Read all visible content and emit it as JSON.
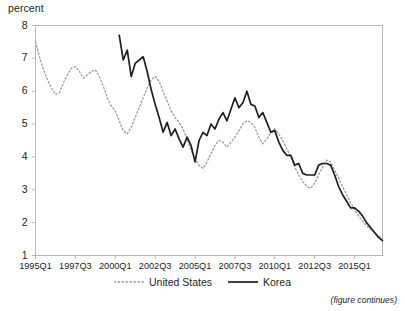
{
  "figure": {
    "axis_unit_label": "percent",
    "note": "(figure continues)"
  },
  "legend": {
    "entries": [
      {
        "label": "United States",
        "style": "dotted",
        "color": "#9a9a9a",
        "icon": "dotted-line-swatch-icon"
      },
      {
        "label": "Korea",
        "style": "solid",
        "color": "#231f20",
        "icon": "solid-line-swatch-icon"
      }
    ]
  },
  "chart_data": {
    "type": "line",
    "title": "",
    "subtitle": "",
    "xlabel": "",
    "ylabel": "percent",
    "ylim": [
      1,
      8
    ],
    "yticks": [
      1,
      2,
      3,
      4,
      5,
      6,
      7,
      8
    ],
    "ytick_labels": [
      "1",
      "2",
      "3",
      "4",
      "5",
      "6",
      "7",
      "8"
    ],
    "xtick_labels": [
      "1995Q1",
      "1997Q3",
      "2000Q1",
      "2002Q3",
      "2005Q1",
      "2007Q3",
      "2010Q1",
      "2012Q3",
      "2015Q1"
    ],
    "xtick_indices": [
      0,
      10,
      20,
      30,
      40,
      50,
      60,
      70,
      80
    ],
    "grid": false,
    "legend_position": "bottom-center",
    "x_start": "1995Q1",
    "x_end": "2016Q4",
    "n_periods": 88,
    "series": [
      {
        "name": "United States",
        "style": "dotted",
        "color": "#9a9a9a",
        "start_index": 0,
        "values": [
          7.5,
          7.05,
          6.65,
          6.35,
          6.1,
          5.9,
          5.95,
          6.25,
          6.5,
          6.7,
          6.75,
          6.6,
          6.4,
          6.5,
          6.6,
          6.65,
          6.45,
          6.15,
          5.8,
          5.55,
          5.4,
          5.1,
          4.8,
          4.7,
          4.9,
          5.2,
          5.5,
          5.8,
          6.1,
          6.35,
          6.45,
          6.3,
          6.0,
          5.7,
          5.4,
          5.2,
          5.05,
          4.85,
          4.55,
          4.2,
          3.95,
          3.75,
          3.65,
          3.85,
          4.1,
          4.35,
          4.5,
          4.45,
          4.3,
          4.45,
          4.6,
          4.8,
          5.0,
          5.1,
          5.05,
          4.9,
          4.6,
          4.4,
          4.55,
          4.75,
          4.85,
          4.7,
          4.5,
          4.25,
          4.0,
          3.7,
          3.45,
          3.25,
          3.1,
          3.05,
          3.2,
          3.45,
          3.7,
          3.9,
          3.85,
          3.6,
          3.35,
          3.1,
          2.85,
          2.6,
          2.4,
          2.2,
          2.05,
          1.9,
          1.8,
          1.7,
          1.6,
          1.5
        ]
      },
      {
        "name": "Korea",
        "style": "solid",
        "color": "#231f20",
        "start_index": 21,
        "values": [
          7.7,
          6.95,
          7.25,
          6.45,
          6.85,
          6.95,
          7.05,
          6.6,
          6.05,
          5.6,
          5.2,
          4.75,
          5.05,
          4.65,
          4.85,
          4.55,
          4.3,
          4.6,
          4.35,
          3.85,
          4.5,
          4.75,
          4.65,
          5.0,
          4.85,
          5.15,
          5.35,
          5.1,
          5.45,
          5.8,
          5.5,
          5.65,
          6.0,
          5.6,
          5.55,
          5.2,
          5.35,
          5.05,
          4.75,
          4.8,
          4.45,
          4.2,
          4.05,
          4.05,
          3.75,
          3.8,
          3.5,
          3.45,
          3.45,
          3.45,
          3.75,
          3.8,
          3.8,
          3.75,
          3.45,
          3.1,
          2.85,
          2.65,
          2.45,
          2.45,
          2.35,
          2.2,
          2.0,
          1.85,
          1.7,
          1.55,
          1.45
        ]
      }
    ]
  }
}
